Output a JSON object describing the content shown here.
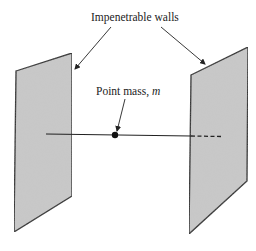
{
  "diagram": {
    "labels": {
      "walls": "Impenetrable walls",
      "point_mass_prefix": "Point mass, ",
      "point_mass_symbol": "m"
    },
    "colors": {
      "wall_fill": "#c9c9c9",
      "stroke": "#222222",
      "background": "#ffffff"
    },
    "elements": [
      {
        "type": "wall",
        "side": "left"
      },
      {
        "type": "wall",
        "side": "right"
      },
      {
        "type": "line",
        "description": "straight line through point mass, dashed behind right wall"
      },
      {
        "type": "point",
        "description": "point mass m"
      }
    ]
  }
}
